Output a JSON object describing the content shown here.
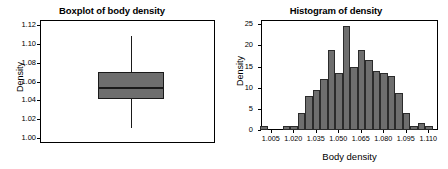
{
  "figure": {
    "width": 448,
    "height": 169,
    "background": "#ffffff",
    "fill_color": "#6e6e6e",
    "line_color": "#1a1a1a"
  },
  "chart_data": [
    {
      "type": "boxplot",
      "panel": "left",
      "title": "Boxplot of body density",
      "xlabel": "",
      "ylabel": "Density",
      "ylim": [
        0.995,
        1.125
      ],
      "yticks": [
        1.0,
        1.02,
        1.04,
        1.06,
        1.08,
        1.1,
        1.12
      ],
      "ytick_labels": [
        "1.00",
        "1.02",
        "1.04",
        "1.06",
        "1.08",
        "1.10",
        "1.12"
      ],
      "grid": false,
      "legend": null,
      "box": {
        "lower_whisker": 1.011,
        "q1": 1.0415,
        "median": 1.0545,
        "q3": 1.0705,
        "upper_whisker": 1.1085,
        "outliers": []
      }
    },
    {
      "type": "bar",
      "subtype": "histogram",
      "panel": "right",
      "title": "Histogram of density",
      "xlabel": "Body density",
      "ylabel": "Density",
      "ylim": [
        0,
        26
      ],
      "yticks": [
        0,
        5,
        10,
        15,
        20,
        25
      ],
      "ytick_labels": [
        "0",
        "5",
        "10",
        "15",
        "20",
        "25"
      ],
      "xlim": [
        0.9985,
        1.1165
      ],
      "xticks": [
        1.005,
        1.02,
        1.035,
        1.05,
        1.065,
        1.08,
        1.095,
        1.11
      ],
      "xtick_labels": [
        "1.005",
        "1.020",
        "1.035",
        "1.050",
        "1.065",
        "1.080",
        "1.095",
        "1.110"
      ],
      "grid": false,
      "legend": null,
      "bin_width": 0.005,
      "bin_centers": [
        1.0005,
        1.0055,
        1.0105,
        1.0155,
        1.0205,
        1.0255,
        1.0305,
        1.0355,
        1.0405,
        1.0455,
        1.0505,
        1.0555,
        1.0605,
        1.0655,
        1.0705,
        1.0755,
        1.0805,
        1.0855,
        1.0905,
        1.0955,
        1.1005,
        1.1055,
        1.1105
      ],
      "values": [
        1,
        0,
        0,
        1,
        1,
        4,
        8,
        9.5,
        12,
        19,
        13.5,
        24.7,
        15,
        19,
        16.5,
        14,
        13.5,
        12.7,
        8.8,
        4,
        1,
        1.6,
        1
      ]
    }
  ]
}
